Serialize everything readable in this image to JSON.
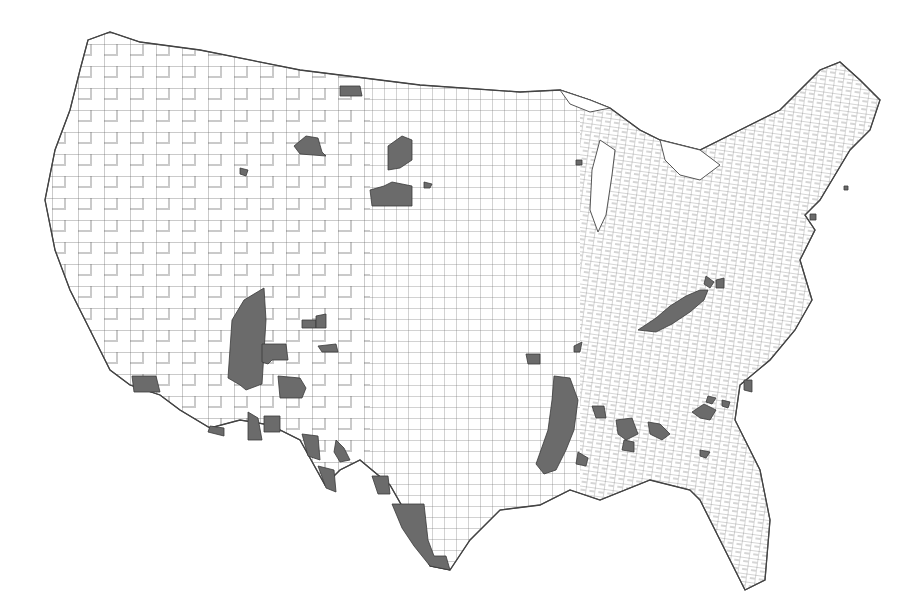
{
  "map": {
    "type": "choropleth",
    "geography": "Contiguous United States (county boundaries)",
    "colors": {
      "background": "#ffffff",
      "county_fill": "#ffffff",
      "county_border": "#555555",
      "highlight_fill": "#6b6b6b"
    },
    "legend": null,
    "title": null,
    "highlighted_regions": [
      {
        "id": "nm-az-border",
        "label": "Arizona / New Mexico border counties"
      },
      {
        "id": "sw-arizona",
        "label": "Southwest Arizona county"
      },
      {
        "id": "se-arizona",
        "label": "Southeast Arizona counties"
      },
      {
        "id": "nm-central",
        "label": "Central New Mexico counties"
      },
      {
        "id": "nm-south",
        "label": "Southern New Mexico counties"
      },
      {
        "id": "west-texas",
        "label": "West Texas border counties"
      },
      {
        "id": "south-texas",
        "label": "South Texas / Rio Grande Valley counties"
      },
      {
        "id": "montana",
        "label": "Montana counties"
      },
      {
        "id": "dakotas",
        "label": "North/South Dakota counties"
      },
      {
        "id": "colorado",
        "label": "Colorado counties"
      },
      {
        "id": "mississippi-delta",
        "label": "Mississippi Delta counties"
      },
      {
        "id": "alabama-black-belt",
        "label": "Alabama Black Belt counties"
      },
      {
        "id": "georgia",
        "label": "Georgia counties"
      },
      {
        "id": "carolinas",
        "label": "South/North Carolina counties"
      },
      {
        "id": "appalachia",
        "label": "Eastern Kentucky Appalachian counties"
      },
      {
        "id": "wisconsin",
        "label": "Wisconsin county"
      },
      {
        "id": "northeast",
        "label": "Northeast metro counties"
      }
    ]
  }
}
